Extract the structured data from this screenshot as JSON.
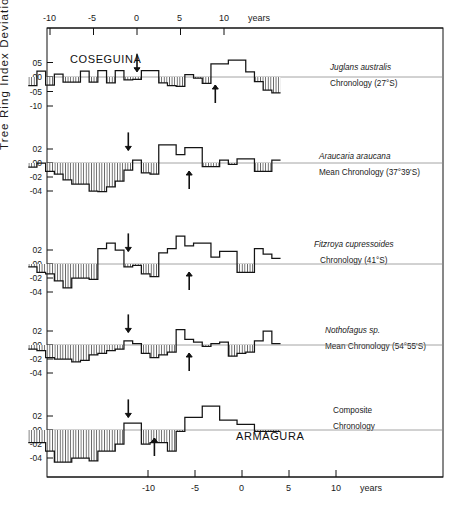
{
  "figure": {
    "y_axis_title": "Tree Ring  Index  Deviation",
    "x_unit_top": "years",
    "x_unit_bottom": "years",
    "annotation_eruption_top": "COSEGUINA",
    "annotation_eruption_bottom": "ARMAGURA"
  },
  "axes": {
    "top_ticks": [
      "-10",
      "-5",
      "0",
      "5",
      "10"
    ],
    "bottom_ticks": [
      "-10",
      "-5",
      "0",
      "5",
      "10"
    ]
  },
  "panels": [
    {
      "id": "juglans",
      "label_line1": "Juglans australis",
      "label_line2": "Chronology (27°S)",
      "y_ticks": [
        "05",
        "00",
        "-05",
        "-10"
      ]
    },
    {
      "id": "araucaria",
      "label_line1": "Araucaria araucana",
      "label_line2": "Mean Chronology (37°39'S)",
      "y_ticks": [
        "02",
        "00",
        "-02",
        "-04"
      ]
    },
    {
      "id": "fitzroya",
      "label_line1": "Fitzroya cupressoides",
      "label_line2": "Chronology (41°S)",
      "y_ticks": [
        "02",
        "00",
        "-02",
        "-04"
      ]
    },
    {
      "id": "nothofagus",
      "label_line1": "Nothofagus sp.",
      "label_line2": "Mean Chronology (54°55'S)",
      "y_ticks": [
        "02",
        "00",
        "-02",
        "-04"
      ]
    },
    {
      "id": "composite",
      "label_line1": "Composite",
      "label_line2": "Chronology",
      "y_ticks": [
        "02",
        "00",
        "-02",
        "-04"
      ]
    }
  ],
  "chart_data": {
    "type": "bar",
    "title": "",
    "xlabel": "years",
    "ylabel": "Tree Ring Index Deviation",
    "grid": false,
    "legend": "none",
    "note": "Five stacked step/bar panels of tree-ring index deviation vs years relative to volcanic eruption. Negative (below-zero) steps are hatched with vertical lines. Down-arrows mark the COSEGUINA eruption year, up-arrows mark the ARMAGURA eruption year.",
    "x": [
      -12,
      -11,
      -10,
      -9,
      -8,
      -7,
      -6,
      -5,
      -4,
      -3,
      -2,
      -1,
      0,
      1,
      2,
      3,
      4,
      5,
      6,
      7,
      8,
      9,
      10,
      11,
      12,
      13,
      14,
      15,
      16
    ],
    "series": [
      {
        "name": "Juglans australis Chronology (27°S)",
        "ylim": [
          -0.125,
          0.085
        ],
        "yticks": [
          0.05,
          0.0,
          -0.05,
          -0.1
        ],
        "marker_down_year": 0,
        "marker_up_year": 9,
        "values": [
          -0.03,
          0.02,
          -0.028,
          0.01,
          -0.018,
          -0.018,
          0.02,
          -0.018,
          0.022,
          -0.02,
          0.022,
          -0.01,
          -0.008,
          0.022,
          0.022,
          -0.02,
          -0.03,
          -0.032,
          0.008,
          -0.004,
          -0.022,
          0.045,
          0.045,
          0.058,
          0.058,
          0.018,
          -0.016,
          -0.045,
          -0.055
        ]
      },
      {
        "name": "Araucaria araucana Mean Chronology (37°39'S)",
        "ylim": [
          -0.052,
          0.034
        ],
        "yticks": [
          0.02,
          0.0,
          -0.02,
          -0.04
        ],
        "marker_down_year": -1,
        "marker_up_year": 6,
        "values": [
          -0.006,
          0.0,
          -0.012,
          -0.016,
          -0.024,
          -0.03,
          -0.03,
          -0.04,
          -0.041,
          -0.034,
          -0.026,
          -0.01,
          0.004,
          -0.014,
          -0.016,
          0.026,
          0.026,
          0.012,
          0.022,
          0.022,
          -0.005,
          -0.005,
          0.004,
          -0.002,
          0.006,
          0.006,
          -0.012,
          -0.012,
          0.004
        ]
      },
      {
        "name": "Fitzroya cupressoides Chronology (41°S)",
        "ylim": [
          -0.052,
          0.046
        ],
        "yticks": [
          0.02,
          0.0,
          -0.02,
          -0.04
        ],
        "marker_down_year": -1,
        "marker_up_year": 6,
        "values": [
          -0.004,
          -0.012,
          -0.014,
          -0.024,
          -0.034,
          -0.02,
          -0.02,
          -0.022,
          0.022,
          0.03,
          0.02,
          -0.004,
          -0.002,
          -0.014,
          -0.018,
          0.016,
          0.022,
          0.04,
          0.026,
          0.03,
          0.03,
          0.01,
          0.018,
          0.018,
          -0.012,
          -0.012,
          0.022,
          0.014,
          0.008
        ]
      },
      {
        "name": "Nothofagus sp. Mean Chronology (54°55'S)",
        "ylim": [
          -0.052,
          0.036
        ],
        "yticks": [
          0.02,
          0.0,
          -0.02,
          -0.04
        ],
        "marker_down_year": -1,
        "marker_up_year": 6,
        "values": [
          -0.006,
          -0.008,
          -0.018,
          -0.02,
          -0.02,
          -0.024,
          -0.022,
          -0.014,
          -0.012,
          -0.008,
          -0.006,
          0.006,
          0.002,
          -0.012,
          -0.018,
          -0.014,
          -0.01,
          0.022,
          0.008,
          0.004,
          -0.002,
          0.002,
          0.004,
          -0.016,
          -0.012,
          -0.01,
          0.006,
          0.02,
          0.002
        ]
      },
      {
        "name": "Composite Chronology",
        "ylim": [
          -0.056,
          0.04
        ],
        "yticks": [
          0.02,
          0.0,
          -0.02,
          -0.04
        ],
        "marker_down_year": -1,
        "marker_up_year": 2,
        "values": [
          -0.018,
          -0.018,
          -0.03,
          -0.046,
          -0.046,
          -0.04,
          -0.04,
          -0.044,
          -0.03,
          -0.03,
          -0.02,
          0.01,
          0.01,
          -0.02,
          -0.018,
          -0.018,
          -0.03,
          -0.002,
          0.018,
          0.018,
          0.034,
          0.034,
          0.014,
          0.014,
          0.008,
          0.008,
          -0.002,
          -0.002,
          -0.002
        ]
      }
    ]
  }
}
